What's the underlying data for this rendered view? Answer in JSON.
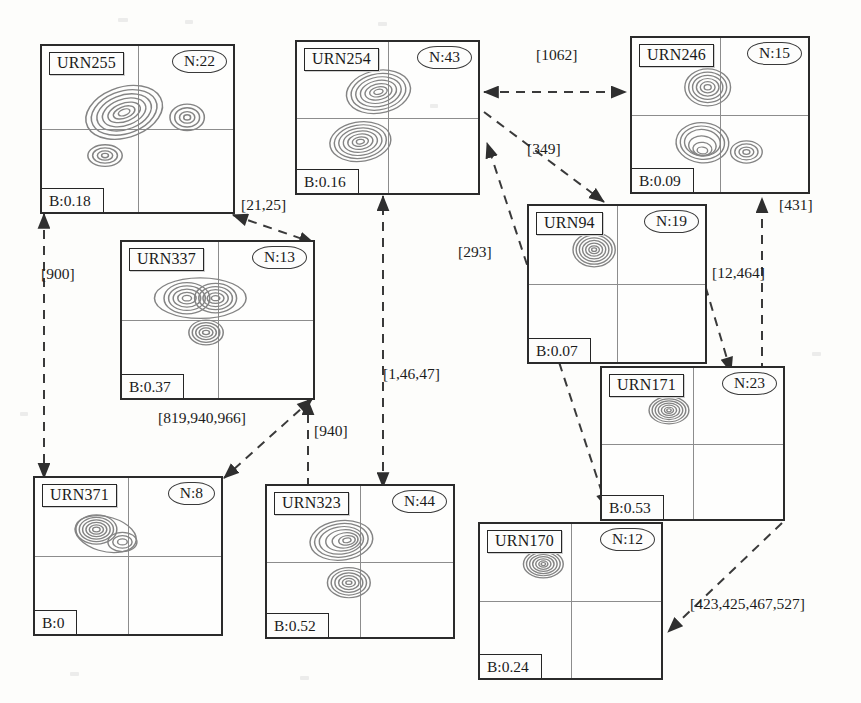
{
  "diagram": {
    "type": "node-link-graph",
    "node_count": 10,
    "edge_count": 10,
    "node_fields": {
      "id_prefix": "URN",
      "count_prefix": "N:",
      "value_prefix": "B:"
    },
    "edge_style": "dashed-arrow"
  },
  "nodes": [
    {
      "id": "URN255",
      "n": "N:22",
      "b": "B:0.18",
      "x": 40,
      "y": 44,
      "w": 195,
      "h": 170,
      "blobs": [
        {
          "cx": 0.43,
          "cy": 0.4,
          "rx": 0.2,
          "ry": 0.14,
          "rot": -25,
          "rings": 7
        },
        {
          "cx": 0.76,
          "cy": 0.43,
          "rx": 0.085,
          "ry": 0.075,
          "rot": 0,
          "rings": 4
        },
        {
          "cx": 0.33,
          "cy": 0.66,
          "rx": 0.085,
          "ry": 0.06,
          "rot": 0,
          "rings": 4
        }
      ]
    },
    {
      "id": "URN254",
      "n": "N:43",
      "b": "B:0.16",
      "x": 295,
      "y": 40,
      "w": 185,
      "h": 155,
      "blobs": [
        {
          "cx": 0.45,
          "cy": 0.33,
          "rx": 0.17,
          "ry": 0.135,
          "rot": -18,
          "rings": 7
        },
        {
          "cx": 0.35,
          "cy": 0.66,
          "rx": 0.16,
          "ry": 0.125,
          "rot": -12,
          "rings": 7
        }
      ]
    },
    {
      "id": "URN246",
      "n": "N:15",
      "b": "B:0.09",
      "x": 630,
      "y": 36,
      "w": 180,
      "h": 158,
      "blobs": [
        {
          "cx": 0.43,
          "cy": 0.32,
          "rx": 0.125,
          "ry": 0.115,
          "rot": 0,
          "rings": 6
        },
        {
          "cx": 0.4,
          "cy": 0.68,
          "rx": 0.145,
          "ry": 0.125,
          "rot": 8,
          "rings": 6
        },
        {
          "cx": 0.65,
          "cy": 0.74,
          "rx": 0.085,
          "ry": 0.07,
          "rot": 0,
          "rings": 4
        }
      ]
    },
    {
      "id": "URN337",
      "n": "N:13",
      "b": "B:0.37",
      "x": 120,
      "y": 240,
      "w": 195,
      "h": 160,
      "blobs": [
        {
          "cx": 0.34,
          "cy": 0.36,
          "rx": 0.115,
          "ry": 0.095,
          "rot": 0,
          "rings": 6
        },
        {
          "cx": 0.49,
          "cy": 0.36,
          "rx": 0.105,
          "ry": 0.09,
          "rot": 0,
          "rings": 6
        },
        {
          "cx": 0.44,
          "cy": 0.58,
          "rx": 0.085,
          "ry": 0.075,
          "rot": 0,
          "rings": 5
        }
      ]
    },
    {
      "id": "URN94",
      "n": "N:19",
      "b": "B:0.07",
      "x": 527,
      "y": 204,
      "w": 180,
      "h": 160,
      "blobs": [
        {
          "cx": 0.37,
          "cy": 0.28,
          "rx": 0.115,
          "ry": 0.105,
          "rot": 0,
          "rings": 7
        }
      ]
    },
    {
      "id": "URN171",
      "n": "N:23",
      "b": "B:0.53",
      "x": 600,
      "y": 366,
      "w": 185,
      "h": 155,
      "blobs": [
        {
          "cx": 0.37,
          "cy": 0.28,
          "rx": 0.105,
          "ry": 0.085,
          "rot": 0,
          "rings": 7
        }
      ]
    },
    {
      "id": "URN371",
      "n": "N:8",
      "b": "B:0",
      "x": 33,
      "y": 476,
      "w": 190,
      "h": 160,
      "blobs": [
        {
          "cx": 0.33,
          "cy": 0.33,
          "rx": 0.105,
          "ry": 0.09,
          "rot": 0,
          "rings": 7
        },
        {
          "cx": 0.47,
          "cy": 0.41,
          "rx": 0.075,
          "ry": 0.06,
          "rot": 0,
          "rings": 3
        }
      ]
    },
    {
      "id": "URN323",
      "n": "N:44",
      "b": "B:0.52",
      "x": 265,
      "y": 484,
      "w": 190,
      "h": 155,
      "blobs": [
        {
          "cx": 0.4,
          "cy": 0.36,
          "rx": 0.165,
          "ry": 0.125,
          "rot": -12,
          "rings": 7
        },
        {
          "cx": 0.44,
          "cy": 0.64,
          "rx": 0.11,
          "ry": 0.095,
          "rot": 0,
          "rings": 6
        }
      ]
    },
    {
      "id": "URN170",
      "n": "N:12",
      "b": "B:0.24",
      "x": 478,
      "y": 522,
      "w": 185,
      "h": 158,
      "blobs": [
        {
          "cx": 0.35,
          "cy": 0.26,
          "rx": 0.105,
          "ry": 0.085,
          "rot": 0,
          "rings": 7
        }
      ]
    }
  ],
  "edges": [
    {
      "label": "[1062]",
      "from": "URN254",
      "to": "URN246",
      "lx": 536,
      "ly": 46,
      "arrows": "both"
    },
    {
      "label": "[349]",
      "from": "URN254",
      "to": "URN94",
      "lx": 527,
      "ly": 140,
      "arrows": "end"
    },
    {
      "label": "[431]",
      "from": "URN171",
      "to": "URN246",
      "lx": 779,
      "ly": 196,
      "arrows": "end"
    },
    {
      "label": "[12,464]",
      "from": "URN171",
      "to": "URN94",
      "lx": 712,
      "ly": 264,
      "arrows": "both"
    },
    {
      "label": "[293]",
      "from": "URN171",
      "to": "URN254",
      "lx": 458,
      "ly": 243,
      "arrows": "both"
    },
    {
      "label": "[21,25]",
      "from": "URN255",
      "to": "URN337",
      "lx": 241,
      "ly": 196,
      "arrows": "both"
    },
    {
      "label": "[900]",
      "from": "URN255",
      "to": "URN371",
      "lx": 41,
      "ly": 265,
      "arrows": "both"
    },
    {
      "label": "[819,940,966]",
      "from": "URN337",
      "to": "URN371",
      "lx": 158,
      "ly": 409,
      "arrows": "both"
    },
    {
      "label": "[940]",
      "from": "URN323",
      "to": "URN337",
      "lx": 314,
      "ly": 422,
      "arrows": "end"
    },
    {
      "label": "[1,46,47]",
      "from": "URN323",
      "to": "URN254",
      "lx": 383,
      "ly": 365,
      "arrows": "both"
    },
    {
      "label": "[423,425,467,527]",
      "from": "URN171",
      "to": "URN170",
      "lx": 690,
      "ly": 595,
      "arrows": "end"
    }
  ],
  "colors": {
    "page_background": "#fdfdfb",
    "node_border": "#2b2b2b",
    "grid_line": "#8d8d8d",
    "edge_line": "#3a3a3a",
    "contour": "#7a7a7a",
    "text": "#1a1a1a"
  }
}
